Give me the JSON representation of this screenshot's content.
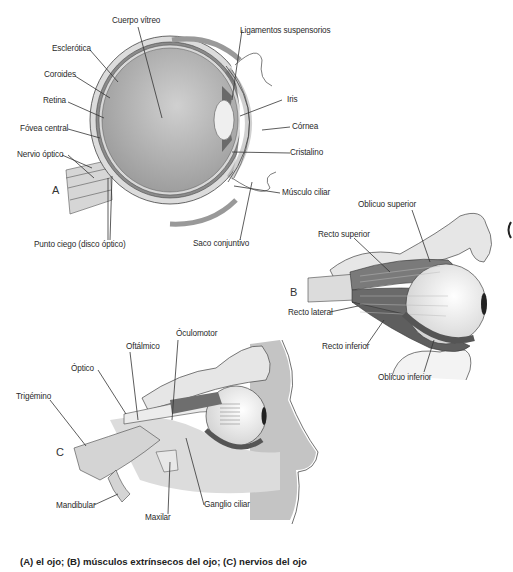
{
  "figure": {
    "caption": "(A) el ojo; (B) músculos extrínsecos del ojo; (C) nervios del ojo",
    "colors": {
      "background": "#ffffff",
      "vitreous": "#b8b8b8",
      "sclera": "#d6d6d6",
      "muscle": "#6e6e6e",
      "bone": "#e4e4e4",
      "tissue": "#c9c9c9",
      "line": "#333333"
    }
  },
  "panel_a": {
    "letter": "A",
    "title": "el ojo",
    "labels": {
      "cuerpo_vitreo": "Cuerpo vítreo",
      "esclerotica": "Esclerótica",
      "coroides": "Coroides",
      "retina": "Retina",
      "fovea_central": "Fóvea central",
      "nervio_optico": "Nervio óptico",
      "punto_ciego": "Punto ciego (disco óptico)",
      "ligamentos": "Ligamentos suspensorios",
      "iris": "Iris",
      "cornea": "Córnea",
      "cristalino": "Cristalino",
      "musculo_ciliar": "Músculo ciliar",
      "saco_conjuntivo": "Saco conjuntivo"
    }
  },
  "panel_b": {
    "letter": "B",
    "title": "músculos extrínsecos del ojo",
    "labels": {
      "oblicuo_superior": "Oblicuo superior",
      "recto_superior": "Recto superior",
      "recto_lateral": "Recto lateral",
      "recto_inferior": "Recto inferior",
      "oblicuo_inferior": "Oblicuo inferior"
    }
  },
  "panel_c": {
    "letter": "C",
    "title": "nervios del ojo",
    "labels": {
      "oculomotor": "Óculomotor",
      "oftalmico": "Oftálmico",
      "optico": "Óptico",
      "trigemino": "Trigémino",
      "mandibular": "Mandibular",
      "maxilar": "Maxilar",
      "ganglio_ciliar": "Ganglio ciliar"
    }
  }
}
